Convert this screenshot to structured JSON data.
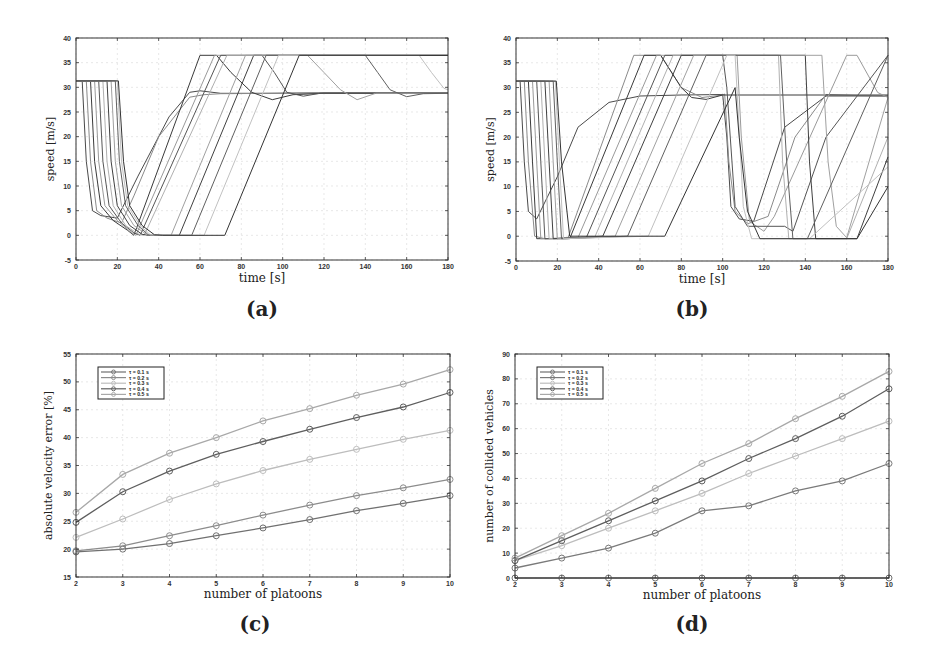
{
  "captions": {
    "a": "(a)",
    "b": "(b)",
    "c": "(c)",
    "d": "(d)"
  },
  "chart_data": [
    {
      "id": "a",
      "type": "line",
      "title": "",
      "xlabel": "time [s]",
      "ylabel": "speed [m/s]",
      "xlim": [
        0,
        180
      ],
      "ylim": [
        -5,
        40
      ],
      "xticks": [
        0,
        20,
        40,
        60,
        80,
        100,
        120,
        140,
        160,
        180
      ],
      "yticks": [
        -5,
        0,
        5,
        10,
        15,
        20,
        25,
        30,
        35,
        40
      ],
      "grid": true,
      "legend": null,
      "description": "Speed trajectories of vehicles in multiple platoons; vehicles start at ~31.3 m/s, brake to ~0-4 m/s around t=5-35 s, accelerate linearly to 36.5 m/s cap or settle near 28.8 m/s.",
      "series": [
        {
          "name": "v1",
          "x": [
            0,
            3,
            5,
            8,
            12,
            20,
            30,
            45,
            55,
            60,
            70,
            90,
            120,
            180
          ],
          "y": [
            31.3,
            31.3,
            15,
            5,
            4,
            3.5,
            12,
            24,
            29,
            29.3,
            28.8,
            28.8,
            28.9,
            28.9
          ]
        },
        {
          "name": "v2",
          "x": [
            0,
            5,
            7,
            10,
            15,
            22,
            28,
            40,
            55,
            62,
            70,
            100,
            180
          ],
          "y": [
            31.3,
            31.3,
            15,
            5,
            3.5,
            2.5,
            8,
            20,
            28,
            28.5,
            28.7,
            28.8,
            28.8
          ]
        },
        {
          "name": "v3",
          "x": [
            0,
            7,
            9,
            12,
            18,
            25,
            28,
            60,
            68,
            75,
            85,
            95,
            105,
            120,
            180
          ],
          "y": [
            31.3,
            31.3,
            15,
            6,
            3,
            1,
            0,
            36.5,
            36.5,
            33,
            29,
            27.5,
            28.5,
            28.8,
            28.8
          ]
        },
        {
          "name": "v4",
          "x": [
            0,
            9,
            11,
            14,
            20,
            27,
            29,
            67,
            180
          ],
          "y": [
            31.3,
            31.3,
            15,
            6,
            3,
            0.5,
            0,
            36.5,
            36.5
          ]
        },
        {
          "name": "v5",
          "x": [
            0,
            11,
            13,
            16,
            22,
            28,
            31,
            70,
            90,
            96,
            102,
            110,
            118,
            180
          ],
          "y": [
            31.3,
            31.3,
            15,
            6,
            2.5,
            0.5,
            0,
            36.5,
            36.5,
            33,
            29,
            28.2,
            28.8,
            28.8
          ]
        },
        {
          "name": "v6",
          "x": [
            0,
            13,
            15,
            18,
            24,
            30,
            33,
            73,
            180
          ],
          "y": [
            31.3,
            31.3,
            15,
            6,
            2,
            0.3,
            0,
            36.5,
            36.5
          ]
        },
        {
          "name": "v7",
          "x": [
            0,
            15,
            17,
            20,
            26,
            32,
            35,
            50,
            86,
            180
          ],
          "y": [
            31.3,
            31.3,
            15,
            6,
            2,
            0.2,
            0,
            0,
            36.5,
            36.5
          ]
        },
        {
          "name": "v8",
          "x": [
            0,
            17,
            19,
            22,
            28,
            34,
            36,
            46,
            82,
            112,
            120,
            128,
            136,
            145,
            180
          ],
          "y": [
            31.3,
            31.3,
            15,
            6,
            2,
            0.2,
            0,
            0,
            36.5,
            36.5,
            33,
            29.5,
            27.5,
            28.8,
            28.8
          ]
        },
        {
          "name": "v9",
          "x": [
            0,
            19,
            21,
            24,
            30,
            35,
            38,
            56,
            92,
            140,
            146,
            152,
            160,
            168,
            180
          ],
          "y": [
            31.3,
            31.3,
            15,
            6,
            2,
            0.1,
            0,
            0,
            36.5,
            36.5,
            33,
            29.5,
            28.1,
            28.7,
            28.8
          ]
        },
        {
          "name": "v10",
          "x": [
            0,
            20,
            22,
            25,
            31,
            36,
            40,
            62,
            98,
            166,
            172,
            178,
            180
          ],
          "y": [
            31.3,
            31.3,
            15,
            6,
            2,
            0.1,
            0,
            0,
            36.5,
            36.5,
            33,
            29.8,
            29.5
          ]
        },
        {
          "name": "v11",
          "x": [
            0,
            20.5,
            23,
            26,
            32,
            38,
            42,
            72,
            108,
            180
          ],
          "y": [
            31.3,
            31.3,
            15,
            6,
            2,
            0.1,
            0,
            0,
            36.5,
            36.5
          ]
        }
      ]
    },
    {
      "id": "b",
      "type": "line",
      "title": "",
      "xlabel": "time [s]",
      "ylabel": "speed [m/s]",
      "xlim": [
        0,
        180
      ],
      "ylim": [
        -5,
        40
      ],
      "xticks": [
        0,
        20,
        40,
        60,
        80,
        100,
        120,
        140,
        160,
        180
      ],
      "yticks": [
        -5,
        0,
        5,
        10,
        15,
        20,
        25,
        30,
        35,
        40
      ],
      "grid": true,
      "legend": null,
      "description": "Speed trajectories with two braking waves: first around t=3-26 s, second around t=100-175 s; speeds saturate at 36.5 m/s or settle near 28.5 m/s.",
      "series": [
        {
          "name": "v1",
          "x": [
            0,
            2,
            4,
            6,
            10,
            20,
            30,
            45,
            60,
            80,
            100,
            102,
            104,
            108,
            115,
            130,
            150,
            180
          ],
          "y": [
            31.3,
            31.3,
            15,
            5,
            3.5,
            12,
            22,
            27,
            28.3,
            28.5,
            28.6,
            20,
            6,
            3.5,
            3,
            22,
            28.3,
            28.3
          ]
        },
        {
          "name": "v2",
          "x": [
            0,
            4,
            6,
            9,
            14,
            25,
            57,
            70,
            80,
            90,
            100,
            101,
            103,
            106,
            112,
            122,
            135,
            150,
            180
          ],
          "y": [
            31.3,
            31.3,
            15,
            0,
            -0.5,
            -0.5,
            36.5,
            36.5,
            30,
            28,
            28.5,
            28.7,
            15,
            5,
            2.5,
            4,
            20,
            28.6,
            28.2
          ]
        },
        {
          "name": "v3",
          "x": [
            0,
            6,
            8,
            10,
            26,
            62,
            70,
            80,
            85,
            92,
            100,
            180
          ],
          "y": [
            31.3,
            31.3,
            15,
            -0.5,
            -0.5,
            36.5,
            36.5,
            30,
            28,
            27.6,
            28.5,
            28.5
          ]
        },
        {
          "name": "v4",
          "x": [
            0,
            8,
            10,
            12,
            30,
            68,
            107,
            109,
            113,
            120,
            125,
            160,
            165,
            175,
            180
          ],
          "y": [
            31.3,
            31.3,
            15,
            -0.5,
            -0.3,
            36.5,
            36.5,
            20,
            3,
            1,
            4,
            36.5,
            36.5,
            29,
            28
          ]
        },
        {
          "name": "v5",
          "x": [
            0,
            10,
            12,
            14,
            34,
            72,
            100,
            102,
            106,
            112,
            130,
            134,
            150,
            180
          ],
          "y": [
            31.3,
            31.3,
            15,
            -0.5,
            -0.3,
            36.5,
            36.5,
            30,
            6,
            2,
            2,
            1,
            20,
            36.5
          ]
        },
        {
          "name": "v6",
          "x": [
            0,
            12,
            14,
            16,
            38,
            76,
            127,
            129,
            132,
            160,
            180
          ],
          "y": [
            31.3,
            31.3,
            15,
            -0.5,
            -0.3,
            36.5,
            36.5,
            15,
            -0.5,
            -0.5,
            20
          ]
        },
        {
          "name": "v7",
          "x": [
            0,
            14,
            16,
            18,
            42,
            80,
            140,
            142,
            145,
            165,
            180
          ],
          "y": [
            31.3,
            31.3,
            15,
            -0.5,
            0,
            36.5,
            36.5,
            15,
            -0.5,
            -0.5,
            16
          ]
        },
        {
          "name": "v8",
          "x": [
            0,
            16,
            18,
            20,
            48,
            86,
            148,
            151,
            155,
            160,
            180
          ],
          "y": [
            31.3,
            31.3,
            15,
            -0.5,
            0,
            36.5,
            36.5,
            15,
            2,
            -0.3,
            28
          ]
        },
        {
          "name": "v9",
          "x": [
            0,
            18,
            20,
            22,
            54,
            92,
            128,
            131,
            134,
            141,
            180
          ],
          "y": [
            31.3,
            31.3,
            15,
            -0.5,
            0,
            36.5,
            36.5,
            15,
            -0.5,
            -0.5,
            36.5
          ]
        },
        {
          "name": "v10",
          "x": [
            0,
            19,
            21,
            23,
            64,
            102,
            106,
            110,
            114,
            120,
            142,
            180
          ],
          "y": [
            31.3,
            31.3,
            15,
            -0.5,
            0,
            36.5,
            36.5,
            6,
            -0.5,
            -0.5,
            -0.5,
            14
          ]
        },
        {
          "name": "v11",
          "x": [
            0,
            19.5,
            22,
            26,
            72,
            106,
            108,
            112,
            118,
            165,
            180
          ],
          "y": [
            31.3,
            31.3,
            15,
            0,
            0,
            30,
            20,
            5,
            -0.5,
            -0.5,
            10
          ]
        }
      ]
    },
    {
      "id": "c",
      "type": "line",
      "title": "",
      "xlabel": "number of platoons",
      "ylabel": "absolute velocity error [%]",
      "xlim": [
        2,
        10
      ],
      "ylim": [
        15,
        55
      ],
      "xticks": [
        2,
        3,
        4,
        5,
        6,
        7,
        8,
        9,
        10
      ],
      "yticks": [
        15,
        20,
        25,
        30,
        35,
        40,
        45,
        50,
        55
      ],
      "grid": true,
      "legend_position": "upper left",
      "x": [
        2,
        3,
        4,
        5,
        6,
        7,
        8,
        9,
        10
      ],
      "series": [
        {
          "name": "τ = 0.1 s",
          "color": "#707070",
          "values": [
            19.5,
            20.0,
            21.0,
            22.4,
            23.8,
            25.3,
            26.9,
            28.2,
            29.6
          ]
        },
        {
          "name": "τ = 0.2 s",
          "color": "#8c8c8c",
          "values": [
            19.7,
            20.6,
            22.4,
            24.2,
            26.1,
            27.9,
            29.6,
            31.0,
            32.5
          ]
        },
        {
          "name": "τ = 0.3 s",
          "color": "#bdbdbd",
          "values": [
            22.1,
            25.4,
            28.9,
            31.7,
            34.1,
            36.1,
            37.9,
            39.7,
            41.3
          ]
        },
        {
          "name": "τ = 0.4 s",
          "color": "#5e5e5e",
          "values": [
            24.8,
            30.3,
            34.0,
            37.0,
            39.3,
            41.5,
            43.6,
            45.5,
            48.1
          ]
        },
        {
          "name": "τ = 0.5 s",
          "color": "#a8a8a8",
          "values": [
            26.6,
            33.4,
            37.2,
            40.0,
            43.0,
            45.2,
            47.6,
            49.6,
            52.2
          ]
        }
      ]
    },
    {
      "id": "d",
      "type": "line",
      "title": "",
      "xlabel": "number of platoons",
      "ylabel": "number of collided vehicles",
      "xlim": [
        2,
        10
      ],
      "ylim": [
        0,
        90
      ],
      "xticks": [
        2,
        3,
        4,
        5,
        6,
        7,
        8,
        9,
        10
      ],
      "yticks": [
        0,
        10,
        20,
        30,
        40,
        50,
        60,
        70,
        80,
        90
      ],
      "grid": true,
      "legend_position": "upper left",
      "x": [
        2,
        3,
        4,
        5,
        6,
        7,
        8,
        9,
        10
      ],
      "series": [
        {
          "name": "τ = 0.1 s",
          "color": "#707070",
          "values": [
            0,
            0,
            0,
            0,
            0,
            0,
            0,
            0,
            0
          ]
        },
        {
          "name": "τ = 0.2 s",
          "color": "#7a7a7a",
          "values": [
            4,
            8,
            12,
            18,
            27,
            29,
            35,
            39,
            46
          ]
        },
        {
          "name": "τ = 0.3 s",
          "color": "#bdbdbd",
          "values": [
            7,
            13,
            20,
            27,
            34,
            42,
            49,
            56,
            63
          ]
        },
        {
          "name": "τ = 0.4 s",
          "color": "#5e5e5e",
          "values": [
            7,
            15,
            23,
            31,
            39,
            48,
            56,
            65,
            76
          ]
        },
        {
          "name": "τ = 0.5 s",
          "color": "#a8a8a8",
          "values": [
            8,
            17,
            26,
            36,
            46,
            54,
            64,
            73,
            83
          ]
        }
      ]
    }
  ]
}
